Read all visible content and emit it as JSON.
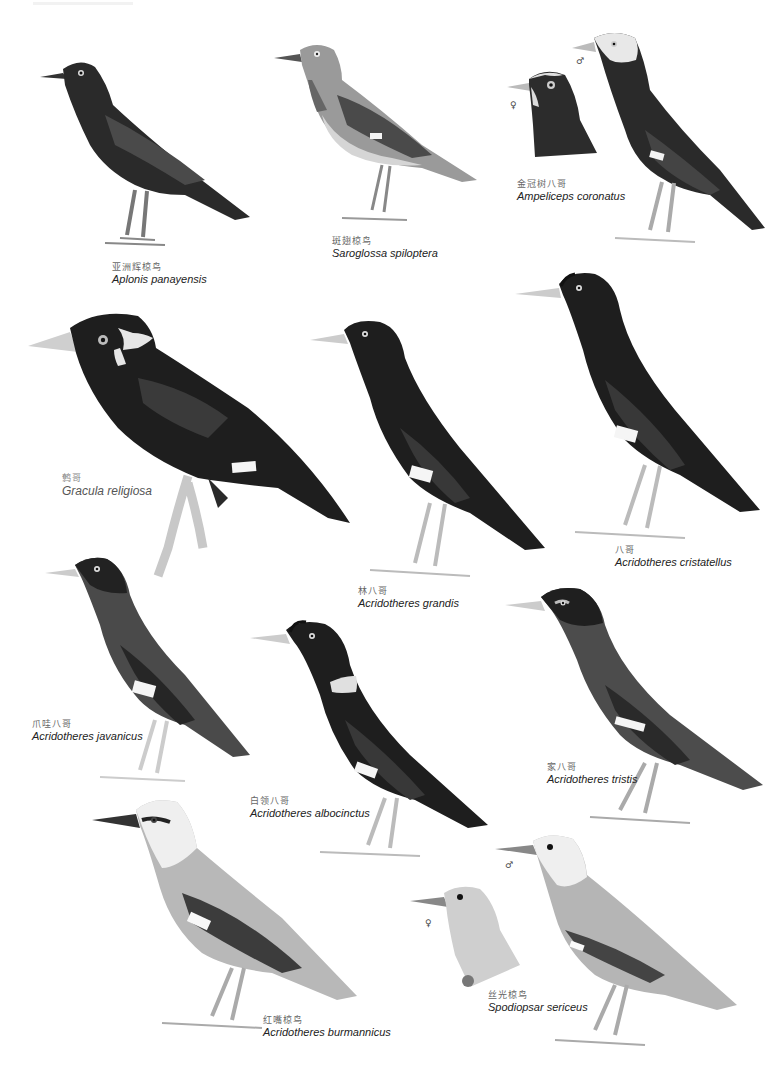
{
  "plate": {
    "background": "#ffffff",
    "palette": {
      "dark": "#1c1c1c",
      "mid": "#6e6e6e",
      "light": "#bdbdbd",
      "pale": "#e4e4e4",
      "white_patch": "#f4f4f4"
    }
  },
  "species": [
    {
      "id": "aplonis",
      "cn": "亚洲辉椋鸟",
      "sci": "Aplonis panayensis"
    },
    {
      "id": "saroglossa",
      "cn": "斑翅椋鸟",
      "sci": "Saroglossa spiloptera"
    },
    {
      "id": "ampeliceps",
      "cn": "金冠树八哥",
      "sci": "Ampeliceps coronatus",
      "sex_male": "♂",
      "sex_female": "♀"
    },
    {
      "id": "gracula",
      "cn": "鹩哥",
      "sci": "Gracula religiosa"
    },
    {
      "id": "grandis",
      "cn": "林八哥",
      "sci": "Acridotheres grandis"
    },
    {
      "id": "cristatellus",
      "cn": "八哥",
      "sci": "Acridotheres cristatellus"
    },
    {
      "id": "javanicus",
      "cn": "爪哇八哥",
      "sci": "Acridotheres javanicus"
    },
    {
      "id": "albocinctus",
      "cn": "白领八哥",
      "sci": "Acridotheres albocinctus"
    },
    {
      "id": "tristis",
      "cn": "家八哥",
      "sci": "Acridotheres tristis"
    },
    {
      "id": "burmannicus",
      "cn": "红嘴椋鸟",
      "sci": "Acridotheres burmannicus"
    },
    {
      "id": "sericeus",
      "cn": "丝光椋鸟",
      "sci": "Spodiopsar sericeus",
      "sex_male": "♂",
      "sex_female": "♀"
    }
  ]
}
